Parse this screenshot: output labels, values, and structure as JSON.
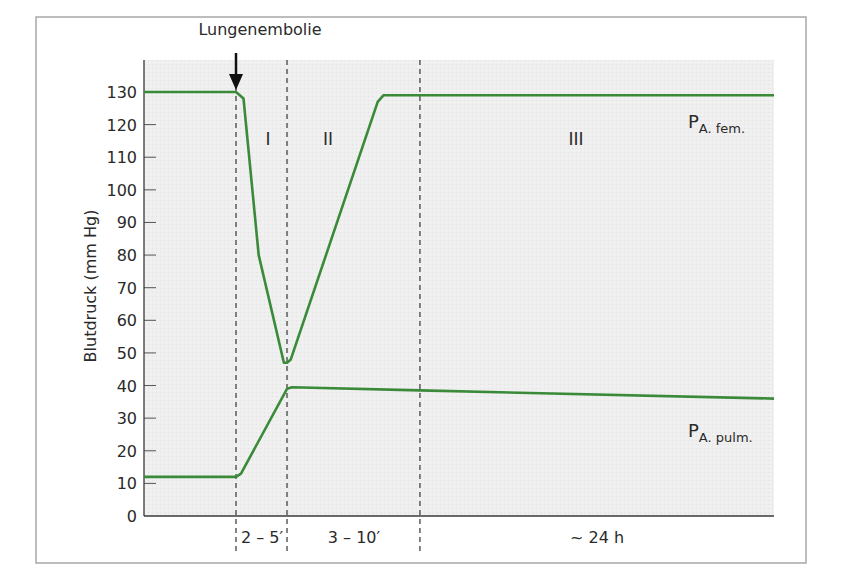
{
  "chart_data": {
    "type": "line",
    "title": "",
    "annotation_event": "Lungenembolie",
    "ylabel": "Blutdruck (mm Hg)",
    "xlabel": "",
    "ylim": [
      0,
      130
    ],
    "yticks": [
      0,
      10,
      20,
      30,
      40,
      50,
      60,
      70,
      80,
      90,
      100,
      110,
      120,
      130
    ],
    "grid": false,
    "legend_position": "inline-right",
    "phases": [
      {
        "label": "I",
        "duration_label": "2 – 5′"
      },
      {
        "label": "II",
        "duration_label": "3 – 10′"
      },
      {
        "label": "III",
        "duration_label": "~ 24 h"
      }
    ],
    "x_note": "x-axis is relative time in phases (not to scale); x in 0–100 normalized units where 14.6=embolism, 22.7=end phase I, 43.8=end phase II, 100=end",
    "series": [
      {
        "name": "P A. fem.",
        "label_main": "P",
        "label_sub": "A. fem.",
        "color": "#3a8a3a",
        "x": [
          0,
          14.6,
          15.8,
          18.2,
          22.2,
          22.7,
          23.3,
          37.1,
          38.0,
          100
        ],
        "y": [
          130,
          130,
          128,
          80,
          47,
          47,
          48,
          127,
          129,
          129
        ]
      },
      {
        "name": "P A. pulm.",
        "label_main": "P",
        "label_sub": "A. pulm.",
        "color": "#3a8a3a",
        "x": [
          0,
          14.6,
          15.4,
          22.7,
          23.5,
          43.8,
          100
        ],
        "y": [
          12,
          12,
          13,
          39,
          39.5,
          38.5,
          36
        ]
      }
    ]
  }
}
